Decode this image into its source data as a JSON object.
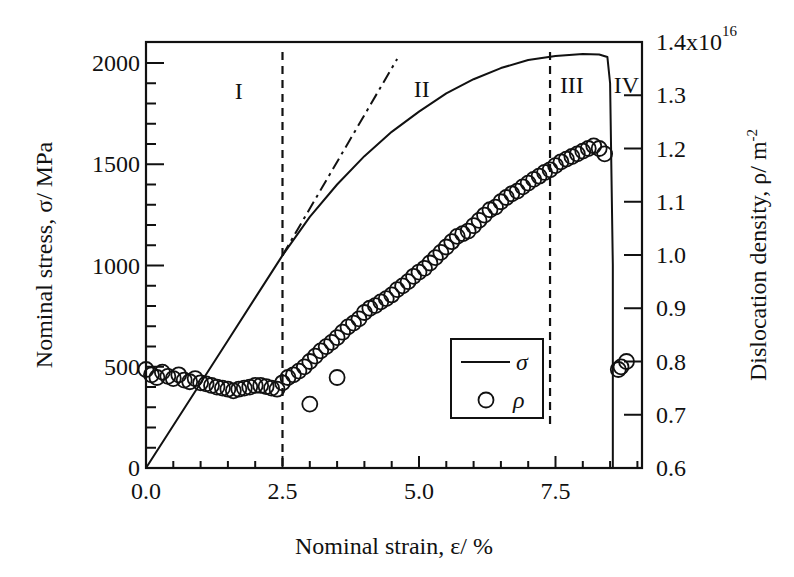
{
  "chart_data": {
    "type": "line+scatter",
    "title": "",
    "xlabel": "Nominal strain, ε/ %",
    "ylabel": "Nominal stress, σ/ MPa",
    "y2label": "Dislocation density, ρ/ m",
    "y2label_sup": "-2",
    "xlim": [
      0,
      9.1
    ],
    "ylim": [
      0,
      2100
    ],
    "y2lim": [
      0.6,
      1.4
    ],
    "y2_multiplier_label": "1.4x10",
    "y2_multiplier_sup": "16",
    "x_ticks": [
      {
        "value": 0.0,
        "label": "0.0"
      },
      {
        "value": 2.5,
        "label": "2.5"
      },
      {
        "value": 5.0,
        "label": "5.0"
      },
      {
        "value": 7.5,
        "label": "7.5"
      }
    ],
    "x_minor_step": 0.5,
    "y_ticks": [
      {
        "value": 0,
        "label": "0"
      },
      {
        "value": 500,
        "label": "500"
      },
      {
        "value": 1000,
        "label": "1000"
      },
      {
        "value": 1500,
        "label": "1500"
      },
      {
        "value": 2000,
        "label": "2000"
      }
    ],
    "y_minor_step": 100,
    "y2_ticks": [
      {
        "value": 0.6,
        "label": "0.6"
      },
      {
        "value": 0.7,
        "label": "0.7"
      },
      {
        "value": 0.8,
        "label": "0.8"
      },
      {
        "value": 0.9,
        "label": "0.9"
      },
      {
        "value": 1.0,
        "label": "1.0"
      },
      {
        "value": 1.1,
        "label": "1.1"
      },
      {
        "value": 1.2,
        "label": "1.2"
      },
      {
        "value": 1.3,
        "label": "1.3"
      }
    ],
    "grid": false,
    "legend": {
      "position": "inside lower right",
      "entries": [
        {
          "label": "σ",
          "marker": "line"
        },
        {
          "label": "ρ",
          "marker": "open-circle"
        }
      ]
    },
    "series": [
      {
        "name": "σ",
        "axis": "left",
        "style": "solid-line",
        "x": [
          0.0,
          0.5,
          1.0,
          1.5,
          2.0,
          2.5,
          3.0,
          3.5,
          4.0,
          4.5,
          5.0,
          5.5,
          6.0,
          6.5,
          7.0,
          7.5,
          8.0,
          8.3,
          8.45,
          8.5,
          8.55,
          8.55
        ],
        "y": [
          0,
          210,
          420,
          630,
          840,
          1050,
          1240,
          1400,
          1540,
          1660,
          1760,
          1850,
          1920,
          1975,
          2015,
          2035,
          2045,
          2042,
          2030,
          1900,
          1000,
          0
        ]
      },
      {
        "name": "elastic extrapolation",
        "axis": "left",
        "style": "dash-dot-line",
        "x": [
          2.5,
          4.6
        ],
        "y": [
          1050,
          2020
        ]
      },
      {
        "name": "ρ",
        "axis": "right",
        "style": "open-circle",
        "unit_multiplier": "1e16",
        "x": [
          0.0,
          0.1,
          0.2,
          0.3,
          0.4,
          0.5,
          0.6,
          0.7,
          0.8,
          0.9,
          1.0,
          1.1,
          1.2,
          1.3,
          1.4,
          1.5,
          1.6,
          1.7,
          1.8,
          1.9,
          2.0,
          2.1,
          2.2,
          2.3,
          2.4,
          2.5,
          2.6,
          2.7,
          2.8,
          2.9,
          3.0,
          3.1,
          3.2,
          3.3,
          3.4,
          3.5,
          3.6,
          3.7,
          3.8,
          3.9,
          4.0,
          4.1,
          4.2,
          4.3,
          4.4,
          4.5,
          4.6,
          4.7,
          4.8,
          4.9,
          5.0,
          5.1,
          5.2,
          5.3,
          5.4,
          5.5,
          5.6,
          5.7,
          5.8,
          5.9,
          6.0,
          6.1,
          6.2,
          6.3,
          6.4,
          6.5,
          6.6,
          6.7,
          6.8,
          6.9,
          7.0,
          7.1,
          7.2,
          7.3,
          7.4,
          7.5,
          7.6,
          7.7,
          7.8,
          7.9,
          8.0,
          8.1,
          8.2,
          8.3,
          8.4,
          3.0,
          3.5,
          8.65,
          8.7,
          8.8
        ],
        "y": [
          0.785,
          0.775,
          0.77,
          0.78,
          0.772,
          0.768,
          0.775,
          0.765,
          0.762,
          0.768,
          0.76,
          0.758,
          0.755,
          0.752,
          0.75,
          0.748,
          0.745,
          0.748,
          0.75,
          0.752,
          0.755,
          0.755,
          0.753,
          0.75,
          0.748,
          0.76,
          0.77,
          0.775,
          0.782,
          0.79,
          0.8,
          0.81,
          0.82,
          0.828,
          0.836,
          0.845,
          0.855,
          0.865,
          0.872,
          0.88,
          0.892,
          0.9,
          0.905,
          0.912,
          0.918,
          0.925,
          0.935,
          0.942,
          0.95,
          0.96,
          0.968,
          0.975,
          0.985,
          0.995,
          1.005,
          1.015,
          1.025,
          1.035,
          1.04,
          1.045,
          1.055,
          1.065,
          1.075,
          1.085,
          1.09,
          1.1,
          1.108,
          1.115,
          1.12,
          1.128,
          1.135,
          1.142,
          1.148,
          1.155,
          1.16,
          1.168,
          1.175,
          1.18,
          1.185,
          1.19,
          1.195,
          1.2,
          1.205,
          1.2,
          1.19,
          0.72,
          0.77,
          0.785,
          0.79,
          0.8
        ]
      }
    ],
    "annotations": [
      {
        "text": "I",
        "x": 1.7,
        "y": 1860,
        "axis": "left"
      },
      {
        "text": "II",
        "x": 5.05,
        "y": 1870,
        "axis": "left"
      },
      {
        "text": "III",
        "x": 7.8,
        "y": 1.32,
        "axis": "right"
      },
      {
        "text": "IV",
        "x": 8.8,
        "y": 1.32,
        "axis": "right"
      }
    ],
    "vertical_lines": [
      {
        "x": 2.5,
        "style": "dashed"
      },
      {
        "x": 7.4,
        "style": "dashed"
      }
    ]
  }
}
